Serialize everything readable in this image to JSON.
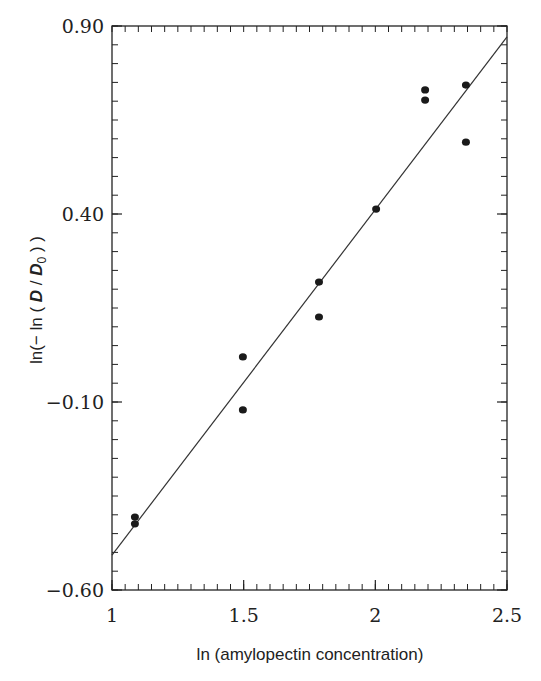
{
  "chart_data": {
    "type": "scatter",
    "title": "",
    "xlabel": "ln (amylopectin concentration)",
    "ylabel": "ln(− ln ( D / D₀ ) )",
    "ylabel_parts": {
      "prefix": "ln(− ln  ( ",
      "D1": "D",
      "slash": " / ",
      "D2": "D",
      "sub": "0",
      "suffix": " ) )"
    },
    "xlim": [
      1,
      2.5
    ],
    "ylim": [
      -0.6,
      0.9
    ],
    "xticks": [
      {
        "value": 1,
        "label": "1"
      },
      {
        "value": 1.5,
        "label": "1.5"
      },
      {
        "value": 2,
        "label": "2"
      },
      {
        "value": 2.5,
        "label": "2.5"
      }
    ],
    "yticks": [
      {
        "value": 0.9,
        "label": "0.90"
      },
      {
        "value": 0.4,
        "label": "0.40"
      },
      {
        "value": -0.1,
        "label": "−0.10"
      },
      {
        "value": -0.6,
        "label": "−0.60"
      }
    ],
    "minor_tick_step_x": 0.05,
    "minor_tick_step_y": 0.05,
    "grid": false,
    "legend": null,
    "series": [
      {
        "name": "measured",
        "marker": "filled-circle",
        "color": "#1a1a1a",
        "points": [
          {
            "x": 1.087,
            "y": -0.406
          },
          {
            "x": 1.087,
            "y": -0.424
          },
          {
            "x": 1.497,
            "y": 0.02
          },
          {
            "x": 1.497,
            "y": -0.121
          },
          {
            "x": 1.786,
            "y": 0.219
          },
          {
            "x": 1.786,
            "y": 0.126
          },
          {
            "x": 2.003,
            "y": 0.413
          },
          {
            "x": 2.189,
            "y": 0.73
          },
          {
            "x": 2.189,
            "y": 0.703
          },
          {
            "x": 2.344,
            "y": 0.743
          },
          {
            "x": 2.344,
            "y": 0.591
          }
        ]
      },
      {
        "name": "linear fit",
        "type": "line",
        "color": "#333333",
        "points": [
          {
            "x": 1.0,
            "y": -0.507
          },
          {
            "x": 2.5,
            "y": 0.871
          }
        ]
      }
    ]
  }
}
